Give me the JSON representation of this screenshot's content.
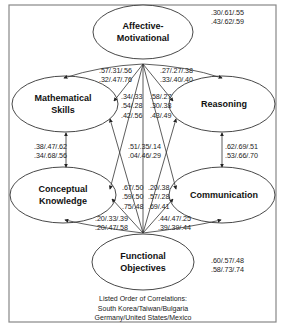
{
  "diagram": {
    "nodes": {
      "affective": {
        "line1": "Affective-",
        "line2": "Motivational"
      },
      "math": {
        "line1": "Mathematical",
        "line2": "Skills"
      },
      "reasoning": {
        "line1": "Reasoning"
      },
      "conceptual": {
        "line1": "Conceptual",
        "line2": "Knowledge"
      },
      "communication": {
        "line1": "Communication"
      },
      "functional": {
        "line1": "Functional",
        "line2": "Objectives"
      }
    },
    "correlations": {
      "affective_functional_corner": {
        "line1": ".30/.61/.55",
        "line2": ".43/.62/.59"
      },
      "affective_math": {
        "line1": ".57/.31/.56",
        "line2": ".32/.47/.76"
      },
      "affective_reasoning": {
        "line1": ".27/.27/.38",
        "line2": ".33/.40/.40"
      },
      "affective_conceptual": {
        "line1": ".34/.33",
        "line2": ".54/.28",
        "line3": ".42/.56"
      },
      "affective_communication": {
        "line1": ".58/.27",
        "line2": ".30/.38",
        "line3": ".43/.49"
      },
      "math_conceptual": {
        "line1": ".38/.47/.62",
        "line2": ".34/.68/.56"
      },
      "reasoning_communication": {
        "line1": ".62/.69/.51",
        "line2": ".53/.66/.70"
      },
      "affective_functional": {
        "line1": ".51/.35/.14",
        "line2": ".04/.46/.29"
      },
      "functional_math": {
        "line1": ".67/.50",
        "line2": ".59/.50",
        "line3": ".75/.48"
      },
      "functional_reasoning": {
        "line1": ".20/.38",
        "line2": ".57/.28",
        "line3": ".69/.41"
      },
      "functional_conceptual": {
        "line1": ".20/.33/.39",
        "line2": ".20/.47/.58"
      },
      "functional_communication": {
        "line1": ".44/.47/.25",
        "line2": ".39/.39/.44"
      },
      "functional_corner": {
        "line1": ".60/.57/.48",
        "line2": ".58/.73/.74"
      }
    },
    "legend": {
      "title": "Listed Order of Correlations:",
      "line1": "South Korea/Taiwan/Bulgaria",
      "line2": "Germany/United States/Mexico"
    },
    "colors": {
      "line": "#333333",
      "frame": "#777777",
      "text": "#1a1a1a"
    }
  }
}
